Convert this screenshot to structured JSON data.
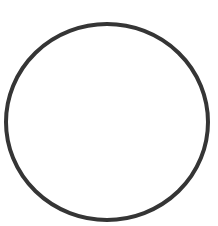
{
  "canvas": {
    "width": 218,
    "height": 226,
    "background": "#ffffff"
  },
  "shape": {
    "type": "ellipse-outline",
    "cx": 107,
    "cy": 122,
    "rx": 101,
    "ry": 98,
    "stroke": "#353535",
    "stroke_width": 4,
    "fill": "none"
  }
}
